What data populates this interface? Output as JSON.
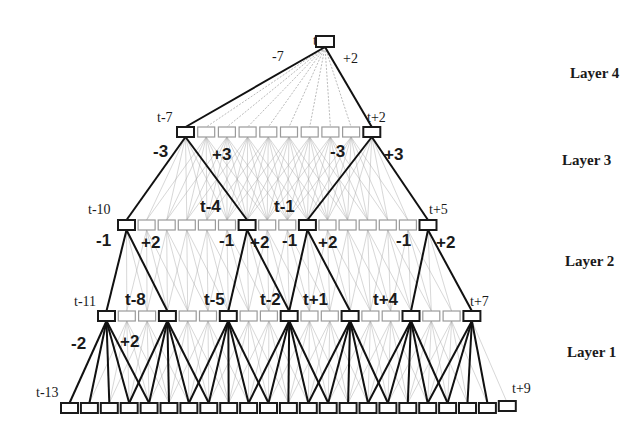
{
  "colors": {
    "bold_edge": "#111111",
    "faint_edge": "#a8a8a8",
    "dark_box": "#1a1a1a",
    "light_box": "#9a9a9a",
    "background": "#ffffff"
  },
  "layer_labels": [
    {
      "text": "Layer 4",
      "x": 570,
      "y": 78
    },
    {
      "text": "Layer 3",
      "x": 562,
      "y": 165
    },
    {
      "text": "Layer 2",
      "x": 565,
      "y": 266
    },
    {
      "text": "Layer 1",
      "x": 567,
      "y": 357
    }
  ],
  "rows": [
    {
      "name": "output",
      "y": 36,
      "x0": 316,
      "step": 0,
      "count": 1,
      "dark": [
        0
      ],
      "box_w": 18,
      "box_h": 11
    },
    {
      "name": "layer3",
      "y": 127,
      "x0": 177,
      "step": 20.7,
      "count": 10,
      "dark": [
        0,
        9
      ],
      "box_w": 17,
      "box_h": 10
    },
    {
      "name": "layer2",
      "y": 220,
      "x0": 118,
      "step": 20.1,
      "count": 16,
      "dark": [
        0,
        6,
        9,
        15
      ],
      "box_w": 17,
      "box_h": 10
    },
    {
      "name": "layer1",
      "y": 311,
      "x0": 98,
      "step": 20.3,
      "count": 19,
      "dark": [
        0,
        3,
        6,
        9,
        12,
        15,
        18
      ],
      "box_w": 17,
      "box_h": 10
    },
    {
      "name": "input",
      "y": 403,
      "x0": 61,
      "step": 19.9,
      "count": 23,
      "dark": [],
      "box_w": 17,
      "box_h": 10
    }
  ],
  "connections": [
    {
      "from_row": 0,
      "from": 0,
      "to_row": 1,
      "to_range": [
        0,
        9
      ],
      "bold": [
        0,
        9
      ]
    },
    {
      "from_row": 1,
      "from": 0,
      "to_row": 2,
      "to_range": [
        0,
        6
      ],
      "bold": [
        0,
        6
      ]
    },
    {
      "from_row": 1,
      "from": 9,
      "to_row": 2,
      "to_range": [
        9,
        15
      ],
      "bold": [
        9,
        15
      ]
    },
    {
      "from_row": 2,
      "from": 0,
      "to_row": 3,
      "to_range": [
        0,
        3
      ],
      "bold": [
        0,
        3
      ]
    },
    {
      "from_row": 2,
      "from": 6,
      "to_row": 3,
      "to_range": [
        6,
        9
      ],
      "bold": [
        6,
        9
      ]
    },
    {
      "from_row": 2,
      "from": 9,
      "to_row": 3,
      "to_range": [
        9,
        12
      ],
      "bold": [
        9,
        12
      ]
    },
    {
      "from_row": 2,
      "from": 15,
      "to_row": 3,
      "to_range": [
        15,
        18
      ],
      "bold": [
        15,
        18
      ]
    },
    {
      "from_row": 3,
      "from": 0,
      "to_row": 4,
      "to_range": [
        0,
        4
      ],
      "bold": [
        0,
        1,
        2,
        3,
        4
      ]
    },
    {
      "from_row": 3,
      "from": 3,
      "to_row": 4,
      "to_range": [
        3,
        7
      ],
      "bold": [
        3,
        4,
        5,
        6,
        7
      ]
    },
    {
      "from_row": 3,
      "from": 6,
      "to_row": 4,
      "to_range": [
        6,
        10
      ],
      "bold": [
        6,
        7,
        8,
        9,
        10
      ]
    },
    {
      "from_row": 3,
      "from": 9,
      "to_row": 4,
      "to_range": [
        9,
        13
      ],
      "bold": [
        9,
        10,
        11,
        12,
        13
      ]
    },
    {
      "from_row": 3,
      "from": 12,
      "to_row": 4,
      "to_range": [
        12,
        16
      ],
      "bold": [
        12,
        13,
        14,
        15,
        16
      ]
    },
    {
      "from_row": 3,
      "from": 15,
      "to_row": 4,
      "to_range": [
        15,
        19
      ],
      "bold": [
        15,
        16,
        17,
        18,
        19
      ]
    },
    {
      "from_row": 3,
      "from": 18,
      "to_row": 4,
      "to_range": [
        18,
        22
      ],
      "bold": [
        18,
        19,
        20,
        21
      ]
    }
  ],
  "faint_mesh": [
    {
      "from_row": 1,
      "to_row": 2,
      "span": [
        0,
        6
      ]
    },
    {
      "from_row": 2,
      "to_row": 3,
      "span": [
        0,
        3
      ]
    },
    {
      "from_row": 3,
      "to_row": 4,
      "span": [
        0,
        4
      ]
    }
  ],
  "node_labels": [
    {
      "text": "t",
      "x": 313,
      "y": 45,
      "cls": "node-label"
    },
    {
      "text": "t-7",
      "x": 157,
      "y": 122,
      "cls": "node-label"
    },
    {
      "text": "t+2",
      "x": 367,
      "y": 122,
      "cls": "node-label"
    },
    {
      "text": "t-10",
      "x": 88,
      "y": 214,
      "cls": "node-label"
    },
    {
      "text": "t-4",
      "x": 200,
      "y": 212,
      "cls": "edge-label"
    },
    {
      "text": "t-1",
      "x": 274,
      "y": 212,
      "cls": "edge-label"
    },
    {
      "text": "t+5",
      "x": 429,
      "y": 214,
      "cls": "node-label"
    },
    {
      "text": "t-11",
      "x": 74,
      "y": 306,
      "cls": "node-label"
    },
    {
      "text": "t-8",
      "x": 125,
      "y": 305,
      "cls": "edge-label"
    },
    {
      "text": "t-5",
      "x": 204,
      "y": 305,
      "cls": "edge-label"
    },
    {
      "text": "t-2",
      "x": 260,
      "y": 305,
      "cls": "edge-label"
    },
    {
      "text": "t+1",
      "x": 303,
      "y": 305,
      "cls": "edge-label"
    },
    {
      "text": "t+4",
      "x": 373,
      "y": 305,
      "cls": "edge-label"
    },
    {
      "text": "t+7",
      "x": 470,
      "y": 306,
      "cls": "node-label"
    },
    {
      "text": "t-13",
      "x": 36,
      "y": 397,
      "cls": "node-label"
    },
    {
      "text": "t+9",
      "x": 512,
      "y": 393,
      "cls": "node-label"
    }
  ],
  "edge_labels": [
    {
      "text": "-7",
      "x": 272,
      "y": 61,
      "cls": "edge-label small"
    },
    {
      "text": "+2",
      "x": 343,
      "y": 63,
      "cls": "edge-label small"
    },
    {
      "text": "-3",
      "x": 153,
      "y": 157,
      "cls": "edge-label"
    },
    {
      "text": "+3",
      "x": 212,
      "y": 160,
      "cls": "edge-label"
    },
    {
      "text": "-3",
      "x": 330,
      "y": 157,
      "cls": "edge-label"
    },
    {
      "text": "+3",
      "x": 384,
      "y": 160,
      "cls": "edge-label"
    },
    {
      "text": "-1",
      "x": 96,
      "y": 246,
      "cls": "edge-label"
    },
    {
      "text": "+2",
      "x": 141,
      "y": 248,
      "cls": "edge-label"
    },
    {
      "text": "-1",
      "x": 219,
      "y": 246,
      "cls": "edge-label"
    },
    {
      "text": "+2",
      "x": 250,
      "y": 248,
      "cls": "edge-label"
    },
    {
      "text": "-1",
      "x": 282,
      "y": 246,
      "cls": "edge-label"
    },
    {
      "text": "+2",
      "x": 318,
      "y": 248,
      "cls": "edge-label"
    },
    {
      "text": "-1",
      "x": 396,
      "y": 246,
      "cls": "edge-label"
    },
    {
      "text": "+2",
      "x": 436,
      "y": 248,
      "cls": "edge-label"
    },
    {
      "text": "-2",
      "x": 71,
      "y": 349,
      "cls": "edge-label"
    },
    {
      "text": "+2",
      "x": 120,
      "y": 347,
      "cls": "edge-label"
    }
  ]
}
